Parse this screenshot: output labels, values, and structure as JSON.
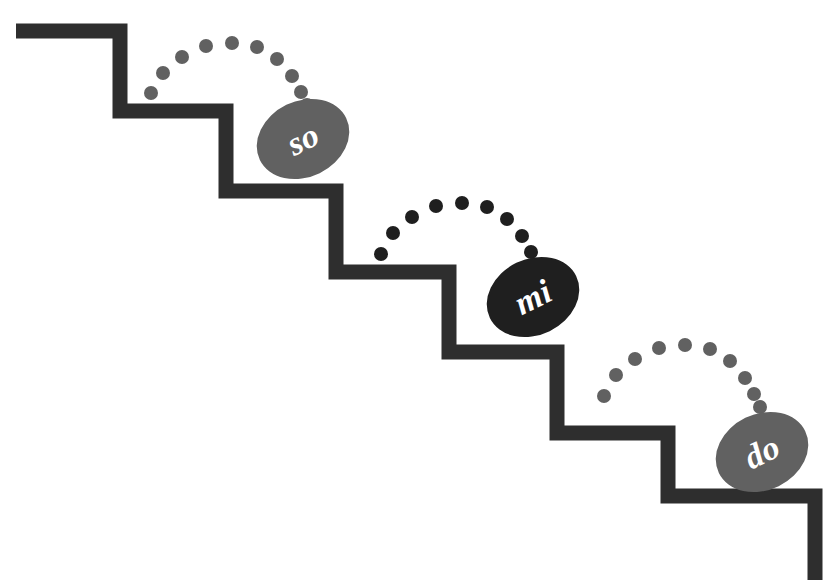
{
  "canvas": {
    "width": 829,
    "height": 583,
    "background": "#ffffff"
  },
  "colors": {
    "staircase": "#2e2e2e",
    "note_gray": "#616161",
    "note_dark": "#1f1f1f",
    "label_text": "#ffffff"
  },
  "staircase": {
    "stroke_width": 15,
    "points": "16,31 120,31 120,111 226,111 226,191 336,191 336,272 449,272 449,352 557,352 557,433 668,433 668,496 815,496 815,580"
  },
  "notes": [
    {
      "id": "so",
      "label": "so",
      "color_key": "note_gray",
      "cx": 303,
      "cy": 139,
      "rx": 48,
      "ry": 38,
      "rotation": -26
    },
    {
      "id": "mi",
      "label": "mi",
      "color_key": "note_dark",
      "cx": 533,
      "cy": 297,
      "rx": 48,
      "ry": 38,
      "rotation": -26
    },
    {
      "id": "do",
      "label": "do",
      "color_key": "note_gray",
      "cx": 762,
      "cy": 452,
      "rx": 48,
      "ry": 38,
      "rotation": -26
    }
  ],
  "arcs": [
    {
      "id": "arc-so",
      "color_key": "note_gray",
      "dot_radius": 7,
      "dots": [
        {
          "x": 151,
          "y": 93
        },
        {
          "x": 163,
          "y": 73
        },
        {
          "x": 182,
          "y": 57
        },
        {
          "x": 206,
          "y": 46
        },
        {
          "x": 232,
          "y": 43
        },
        {
          "x": 257,
          "y": 47
        },
        {
          "x": 277,
          "y": 59
        },
        {
          "x": 292,
          "y": 76
        },
        {
          "x": 301,
          "y": 92
        },
        {
          "x": 307,
          "y": 105
        }
      ]
    },
    {
      "id": "arc-mi",
      "color_key": "note_dark",
      "dot_radius": 7,
      "dots": [
        {
          "x": 381,
          "y": 254
        },
        {
          "x": 393,
          "y": 233
        },
        {
          "x": 412,
          "y": 217
        },
        {
          "x": 436,
          "y": 206
        },
        {
          "x": 462,
          "y": 203
        },
        {
          "x": 487,
          "y": 207
        },
        {
          "x": 507,
          "y": 219
        },
        {
          "x": 522,
          "y": 236
        },
        {
          "x": 531,
          "y": 252
        },
        {
          "x": 537,
          "y": 265
        }
      ]
    },
    {
      "id": "arc-do",
      "color_key": "note_gray",
      "dot_radius": 7,
      "dots": [
        {
          "x": 604,
          "y": 396
        },
        {
          "x": 616,
          "y": 375
        },
        {
          "x": 635,
          "y": 359
        },
        {
          "x": 659,
          "y": 348
        },
        {
          "x": 685,
          "y": 345
        },
        {
          "x": 710,
          "y": 349
        },
        {
          "x": 730,
          "y": 361
        },
        {
          "x": 745,
          "y": 378
        },
        {
          "x": 754,
          "y": 394
        },
        {
          "x": 760,
          "y": 407
        }
      ]
    }
  ]
}
